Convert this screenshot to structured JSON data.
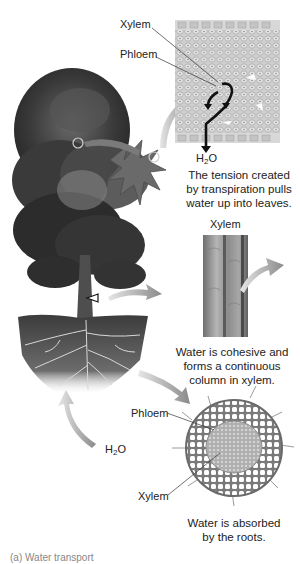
{
  "figure": {
    "colors": {
      "background": "#ffffff",
      "foliage_dark": "#2e2e2e",
      "foliage_mid": "#5a5a5a",
      "soil": "#4a4a4a",
      "arrow_gray": "#9a9a9a",
      "text": "#222222",
      "tissue_light": "#d6d6d6"
    }
  },
  "leaf_panel": {
    "label_xylem": "Xylem",
    "label_phloem": "Phloem",
    "water_label_prefix": "H",
    "water_label_sub": "2",
    "water_label_suffix": "O",
    "caption_line1": "The tension created",
    "caption_line2": "by transpiration pulls",
    "caption_line3": "water up into leaves."
  },
  "stem_panel": {
    "label_xylem": "Xylem",
    "caption_line1": "Water is cohesive and",
    "caption_line2": "forms a continuous",
    "caption_line3": "column in xylem."
  },
  "root_panel": {
    "label_phloem": "Phloem",
    "label_xylem": "Xylem",
    "caption_line1": "Water is absorbed",
    "caption_line2": "by the roots."
  },
  "soil_water": {
    "prefix": "H",
    "sub": "2",
    "suffix": "O"
  },
  "footer": {
    "cut_off_text": "(a) Water transport"
  },
  "icons": {
    "curved_arrow": "curved-arrow-icon",
    "water_flow_arrow": "water-flow-arrow-icon",
    "magnifier_circle": "magnifier-circle-icon",
    "pointer_triangle": "pointer-triangle-icon"
  }
}
